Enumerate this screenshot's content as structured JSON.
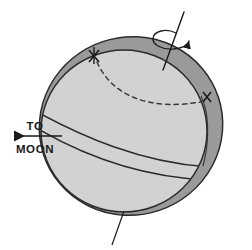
{
  "figure": {
    "background_color": "#ffffff",
    "labels": {
      "to": "TO",
      "moon": "MOON"
    },
    "colors": {
      "shell_fill": "#9a9a9a",
      "interior_fill": "#d2d2d2",
      "outline": "#2b2b2b",
      "label_color": "#1a1a1a",
      "dashed_curve": "#3a3a3a"
    },
    "elements": {
      "tidal_bulge_shell_name": "tidal-bulge-shell",
      "solid_earth_name": "solid-earth-sphere",
      "rotation_axis_name": "rotation-axis",
      "rotation_arrow_name": "rotation-direction-arrow",
      "moon_direction_arrow_name": "to-moon-arrow",
      "dashed_great_circle_name": "dashed-great-circle",
      "band_curve_upper_name": "band-curve-upper",
      "band_curve_lower_name": "band-curve-lower",
      "marker_upper_left_name": "cross-marker-upper-left",
      "marker_right_name": "cross-marker-right",
      "leader_line_name": "shell-leader-line"
    },
    "geometry": {
      "shell_center": [
        131,
        126
      ],
      "shell_rx": 92,
      "shell_ry": 89,
      "shell_rotation_deg": -18,
      "interior_center": [
        124,
        131
      ],
      "interior_rx": 83,
      "interior_ry": 81,
      "axis_top": [
        182,
        14
      ],
      "axis_bottom": [
        164,
        66
      ],
      "rotation_arrow_center": [
        170,
        38
      ],
      "moon_arrow_from": [
        62,
        136
      ],
      "moon_arrow_to": [
        12,
        136
      ],
      "to_label_pos": [
        35,
        131
      ],
      "moon_label_pos": [
        35,
        151
      ],
      "leader_from": [
        124,
        213
      ],
      "leader_to": [
        113,
        244
      ]
    }
  }
}
